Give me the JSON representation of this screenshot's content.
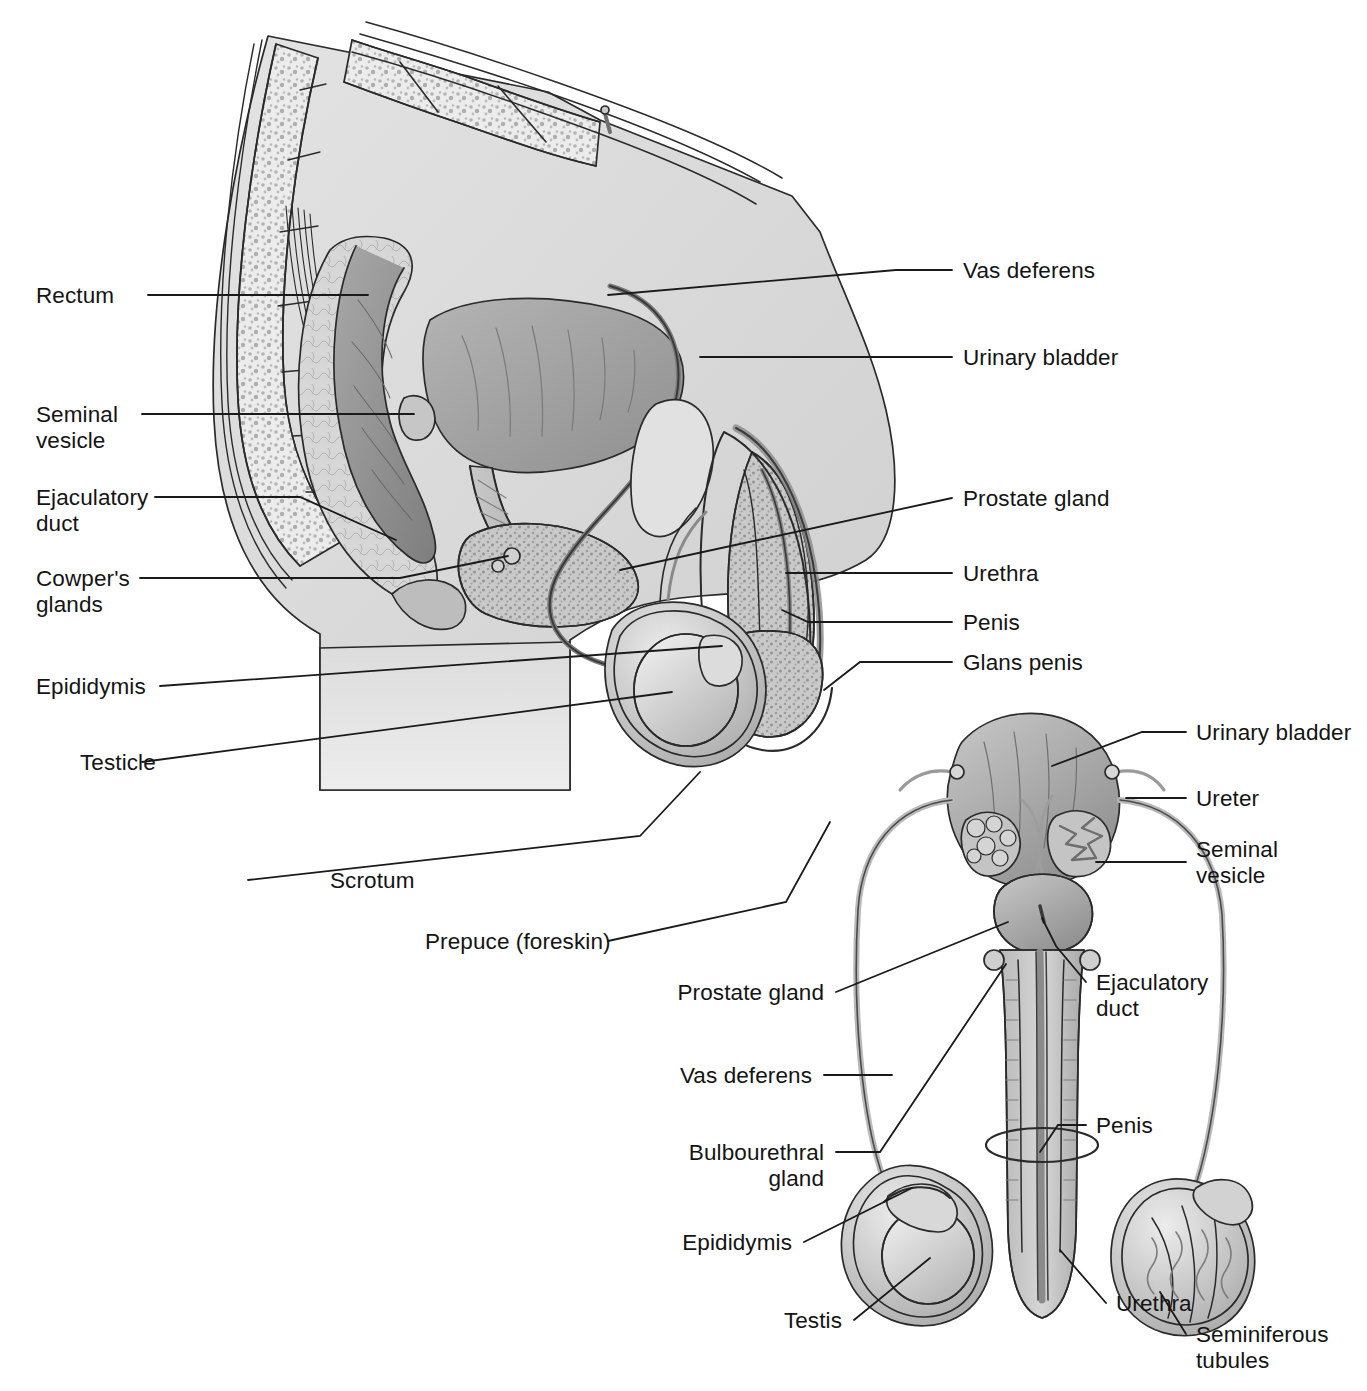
{
  "figure": {
    "views": [
      {
        "id": "sagittal",
        "name": "Midsagittal section of male pelvis"
      },
      {
        "id": "anterior",
        "name": "Anterior view of male reproductive organs"
      }
    ],
    "ink_color": "#141414",
    "line_color": "#1a1a1a",
    "background": "#ffffff"
  },
  "sagittal_labels": {
    "left": [
      {
        "key": "rectum",
        "text": "Rectum"
      },
      {
        "key": "seminal_vesicle",
        "text": "Seminal\nvesicle"
      },
      {
        "key": "ejaculatory_duct",
        "text": "Ejaculatory\nduct"
      },
      {
        "key": "cowpers_glands",
        "text": "Cowper's\nglands"
      },
      {
        "key": "epididymis",
        "text": "Epididymis"
      },
      {
        "key": "testicle",
        "text": "Testicle"
      },
      {
        "key": "scrotum",
        "text": "Scrotum"
      },
      {
        "key": "prepuce",
        "text": "Prepuce (foreskin)"
      }
    ],
    "right": [
      {
        "key": "vas_deferens",
        "text": "Vas deferens"
      },
      {
        "key": "urinary_bladder",
        "text": "Urinary bladder"
      },
      {
        "key": "prostate_gland",
        "text": "Prostate gland"
      },
      {
        "key": "urethra",
        "text": "Urethra"
      },
      {
        "key": "penis",
        "text": "Penis"
      },
      {
        "key": "glans_penis",
        "text": "Glans penis"
      }
    ]
  },
  "anterior_labels": {
    "left": [
      {
        "key": "prostate_gland",
        "text": "Prostate gland"
      },
      {
        "key": "vas_deferens",
        "text": "Vas deferens"
      },
      {
        "key": "bulbourethral_gland",
        "text": "Bulbourethral\ngland"
      },
      {
        "key": "epididymis",
        "text": "Epididymis"
      },
      {
        "key": "testis",
        "text": "Testis"
      }
    ],
    "right": [
      {
        "key": "urinary_bladder",
        "text": "Urinary bladder"
      },
      {
        "key": "ureter",
        "text": "Ureter"
      },
      {
        "key": "seminal_vesicle",
        "text": "Seminal\nvesicle"
      },
      {
        "key": "ejaculatory_duct",
        "text": "Ejaculatory\nduct"
      },
      {
        "key": "penis",
        "text": "Penis"
      },
      {
        "key": "urethra",
        "text": "Urethra"
      },
      {
        "key": "seminiferous_tubules",
        "text": "Seminiferous\ntubules"
      }
    ]
  }
}
